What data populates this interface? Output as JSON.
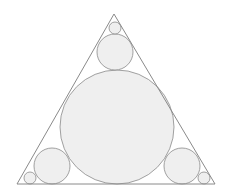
{
  "diagram": {
    "stroke_color": "#8a8a8a",
    "fill_color": "#efefef",
    "triangle": {
      "points": [
        [
          114,
          14
        ],
        [
          17,
          184
        ],
        [
          215,
          184
        ]
      ]
    },
    "circles": [
      {
        "name": "large-incircle",
        "cx": 117,
        "cy": 127,
        "r": 57
      },
      {
        "name": "top-medium-circle",
        "cx": 115,
        "cy": 52,
        "r": 18
      },
      {
        "name": "top-small-circle",
        "cx": 115,
        "cy": 28,
        "r": 6
      },
      {
        "name": "left-medium-circle",
        "cx": 52,
        "cy": 166,
        "r": 18
      },
      {
        "name": "left-small-circle",
        "cx": 30,
        "cy": 178,
        "r": 6
      },
      {
        "name": "right-medium-circle",
        "cx": 182,
        "cy": 166,
        "r": 18
      },
      {
        "name": "right-small-circle",
        "cx": 204,
        "cy": 178,
        "r": 6
      }
    ]
  }
}
